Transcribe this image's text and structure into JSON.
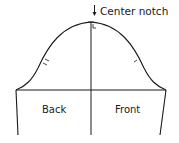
{
  "diagram": {
    "annotations": {
      "center_notch": "Center notch"
    },
    "panels": {
      "back": "Back",
      "front": "Front"
    },
    "colors": {
      "line": "#1a1a1a",
      "background": "#ffffff"
    }
  }
}
